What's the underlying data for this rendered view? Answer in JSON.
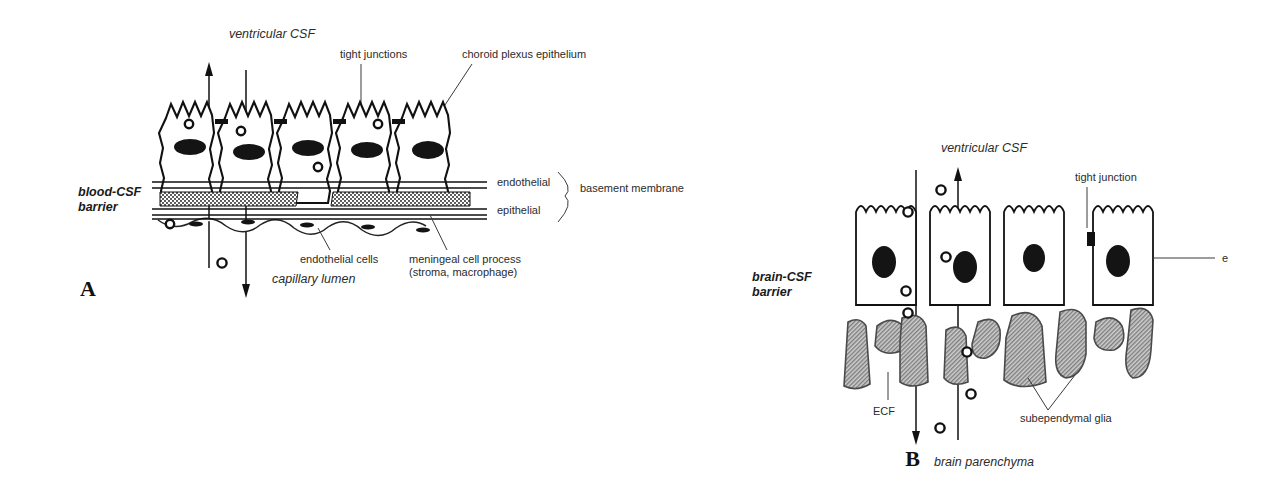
{
  "figure": {
    "panels": [
      {
        "letter": "A",
        "title_region": "blood-CSF barrier at the choroid plexus",
        "barrier_label": "blood-CSF\nbarrier",
        "barrier_label_line1": "blood-CSF",
        "barrier_label_line2": "barrier",
        "top_compartment": "ventricular CSF",
        "bottom_compartment": "capillary lumen",
        "labels": {
          "tight_junctions": "tight junctions",
          "choroid_plexus_epithelium": "choroid plexus epithelium",
          "endothelial": "endothelial",
          "epithelial": "epithelial",
          "basement_membrane": "basement membrane",
          "endothelial_cells": "endothelial cells",
          "meningeal_cell_process_line1": "meningeal cell process",
          "meningeal_cell_process_line2": "(stroma, macrophage)"
        },
        "cell_count": 5,
        "tracer_count": 5
      },
      {
        "letter": "B",
        "title_region": "brain-CSF barrier at the ependyma",
        "barrier_label_line1": "brain-CSF",
        "barrier_label_line2": "barrier",
        "top_compartment": "ventricular CSF",
        "bottom_compartment": "brain parenchyma",
        "labels": {
          "tight_junction": "tight junction",
          "ependyma_truncated": "e",
          "ecf": "ECF",
          "subependymal_glia": "subependymal glia"
        },
        "cell_count": 4,
        "glia_count": 9,
        "tracer_count": 8
      }
    ],
    "colors": {
      "ink": "#111111",
      "nucleus": "#141414",
      "glia_fill": "#9a9a9a",
      "background": "#ffffff",
      "label_text": "#2b2b2b"
    }
  }
}
